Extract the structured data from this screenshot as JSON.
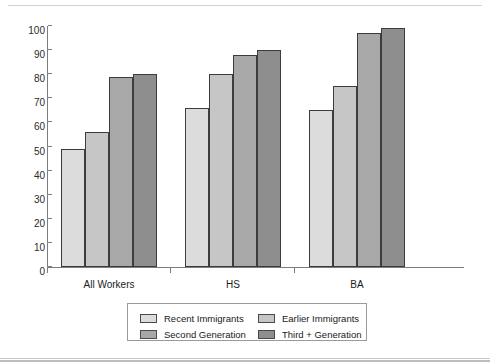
{
  "chart_data": {
    "type": "bar",
    "title": "",
    "xlabel": "",
    "ylabel": "",
    "ylim": [
      0,
      100
    ],
    "ytick_step": 10,
    "grid": false,
    "legend_position": "bottom",
    "categories": [
      "All Workers",
      "HS",
      "BA"
    ],
    "yticks": [
      "0",
      "10",
      "20",
      "30",
      "40",
      "50",
      "60",
      "70",
      "80",
      "90",
      "100"
    ],
    "series": [
      {
        "name": "Recent Immigrants",
        "color": "#dcdcdc",
        "values": [
          49,
          66,
          65
        ]
      },
      {
        "name": "Second Generation",
        "color": "#c6c6c6",
        "values": [
          56,
          80,
          75
        ]
      },
      {
        "name": "Earlier Immigrants",
        "color": "#a8a8a8",
        "values": [
          79,
          88,
          97
        ]
      },
      {
        "name": "Third + Generation",
        "color": "#8e8e8e",
        "values": [
          80,
          90,
          99
        ]
      }
    ],
    "legend_order": [
      "Recent Immigrants",
      "Earlier Immigrants",
      "Second Generation",
      "Third + Generation"
    ]
  },
  "legend": {
    "items": [
      {
        "label": "Recent Immigrants",
        "color": "#dcdcdc"
      },
      {
        "label": "Earlier Immigrants",
        "color": "#c6c6c6"
      },
      {
        "label": "Second Generation",
        "color": "#a8a8a8"
      },
      {
        "label": "Third + Generation",
        "color": "#8e8e8e"
      }
    ]
  }
}
